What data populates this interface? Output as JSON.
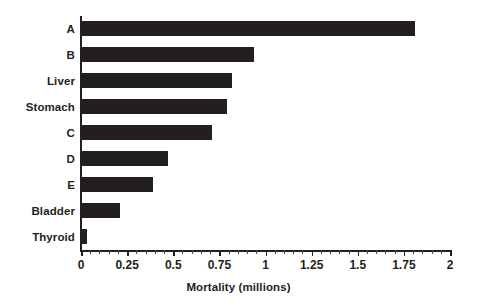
{
  "chart_data": {
    "type": "bar",
    "orientation": "horizontal",
    "title": "",
    "xlabel": "Mortality (millions)",
    "ylabel": "",
    "categories": [
      "A",
      "B",
      "Liver",
      "Stomach",
      "C",
      "D",
      "E",
      "Bladder",
      "Thyroid"
    ],
    "values": [
      1.81,
      0.94,
      0.82,
      0.79,
      0.71,
      0.47,
      0.39,
      0.21,
      0.03
    ],
    "series": [
      {
        "name": "Mortality (millions)",
        "values": [
          1.81,
          0.94,
          0.82,
          0.79,
          0.71,
          0.47,
          0.39,
          0.21,
          0.03
        ]
      }
    ],
    "xlim": [
      0,
      2
    ],
    "xticks": [
      0,
      0.25,
      0.5,
      0.75,
      1,
      1.25,
      1.5,
      1.75,
      2
    ],
    "xtick_labels": [
      "0",
      "0.25",
      "0.5",
      "0.75",
      "1",
      "1.25",
      "1.5",
      "1.75",
      "2"
    ],
    "minor_tick_step": 0.05,
    "grid": false,
    "legend": false,
    "legend_position": "none",
    "bar_color": "#231f20",
    "background_color": "#ffffff",
    "axis_color": "#231f20"
  },
  "axis": {
    "x_title": "Mortality (millions)"
  }
}
